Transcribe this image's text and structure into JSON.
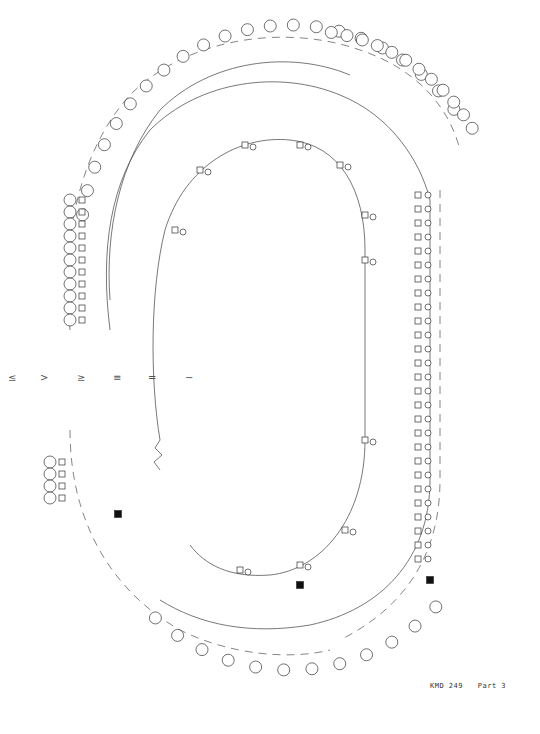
{
  "document": {
    "type": "pedigree-chart",
    "footer": {
      "id": "KMD 249",
      "part": "Part 3"
    }
  },
  "generations": {
    "axis_labels": [
      "VI",
      "V",
      "IV",
      "III",
      "II",
      "I"
    ],
    "axis_label_glyphs": [
      "≤",
      ">",
      "≥",
      "≡",
      "=",
      "−"
    ]
  },
  "legend_symbols": {
    "male": "square",
    "female": "circle",
    "affected": "filled-black",
    "deceased": "small-dot",
    "proband": "arrow",
    "numbered_offspring": "circled-number"
  },
  "visible_ids": {
    "left_upper": [
      "183",
      "184",
      "185",
      "186",
      "187",
      "188",
      "189",
      "190",
      "191",
      "52",
      "53"
    ],
    "left_lower": [
      "319",
      "320",
      "321",
      "322",
      "323",
      "324",
      "325",
      "326",
      "327",
      "106",
      "107",
      "108",
      "610",
      "611",
      "612",
      "613",
      "614",
      "615",
      "616",
      "617"
    ],
    "right_column": [
      "27",
      "28",
      "44",
      "45",
      "46",
      "47"
    ],
    "bottom": [
      "36",
      "37",
      "47"
    ]
  },
  "structure": {
    "inner_loop": "oval (generation I-II spine)",
    "middle_loop": "oval arc (generation III)",
    "dashed_boundary": "dashed arc (generation IV family groups)",
    "break_marker": "zig-zag at left inner gap"
  }
}
